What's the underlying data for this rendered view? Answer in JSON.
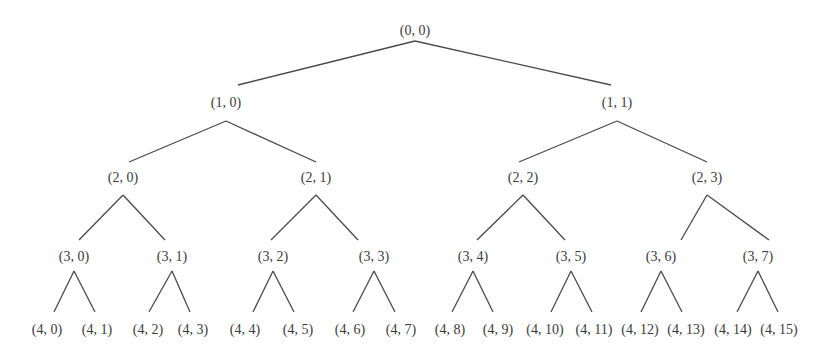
{
  "diagram": {
    "type": "binary-tree",
    "depth": 4,
    "colors": {
      "line": "#4a4a4a",
      "text": "#3a3a3a",
      "background": "#ffffff"
    },
    "levels": [
      {
        "level": 0,
        "label_y": 35,
        "apex_y": 41,
        "nodes": [
          {
            "label": "(0, 0)",
            "x": 415
          }
        ]
      },
      {
        "level": 1,
        "label_y": 107,
        "edge_end_y": 85,
        "apex_y": 121,
        "nodes": [
          {
            "label": "(1, 0)",
            "x": 226,
            "edge_end_x": 238
          },
          {
            "label": "(1, 1)",
            "x": 617,
            "edge_end_x": 611
          }
        ]
      },
      {
        "level": 2,
        "label_y": 182,
        "edge_end_y": 162,
        "apex_y": 195,
        "nodes": [
          {
            "label": "(2, 0)",
            "x": 123,
            "edge_end_x": 129
          },
          {
            "label": "(2, 1)",
            "x": 316,
            "edge_end_x": 316
          },
          {
            "label": "(2, 2)",
            "x": 523,
            "edge_end_x": 519
          },
          {
            "label": "(2, 3)",
            "x": 707,
            "edge_end_x": 707
          }
        ]
      },
      {
        "level": 3,
        "label_y": 261,
        "edge_end_y": 240,
        "apex_y": 271,
        "nodes": [
          {
            "label": "(3, 0)",
            "x": 74,
            "edge_end_x": 79
          },
          {
            "label": "(3, 1)",
            "x": 172,
            "edge_end_x": 165
          },
          {
            "label": "(3, 2)",
            "x": 273,
            "edge_end_x": 271
          },
          {
            "label": "(3, 3)",
            "x": 374,
            "edge_end_x": 358
          },
          {
            "label": "(3, 4)",
            "x": 473,
            "edge_end_x": 477
          },
          {
            "label": "(3, 5)",
            "x": 571,
            "edge_end_x": 565
          },
          {
            "label": "(3, 6)",
            "x": 661,
            "edge_end_x": 681
          },
          {
            "label": "(3, 7)",
            "x": 758,
            "edge_end_x": 769
          }
        ]
      },
      {
        "level": 4,
        "label_y": 334,
        "edge_end_y": 312,
        "nodes": [
          {
            "label": "(4, 0)",
            "x": 47,
            "edge_end_x": 54
          },
          {
            "label": "(4, 1)",
            "x": 97,
            "edge_end_x": 95
          },
          {
            "label": "(4, 2)",
            "x": 148,
            "edge_end_x": 149
          },
          {
            "label": "(4, 3)",
            "x": 193,
            "edge_end_x": 190
          },
          {
            "label": "(4, 4)",
            "x": 245,
            "edge_end_x": 253
          },
          {
            "label": "(4, 5)",
            "x": 298,
            "edge_end_x": 294
          },
          {
            "label": "(4, 6)",
            "x": 350,
            "edge_end_x": 353
          },
          {
            "label": "(4, 7)",
            "x": 401,
            "edge_end_x": 395
          },
          {
            "label": "(4, 8)",
            "x": 450,
            "edge_end_x": 452
          },
          {
            "label": "(4, 9)",
            "x": 498,
            "edge_end_x": 493
          },
          {
            "label": "(4, 10)",
            "x": 545,
            "edge_end_x": 551
          },
          {
            "label": "(4, 11)",
            "x": 594,
            "edge_end_x": 592
          },
          {
            "label": "(4, 12)",
            "x": 640,
            "edge_end_x": 641
          },
          {
            "label": "(4, 13)",
            "x": 686,
            "edge_end_x": 682
          },
          {
            "label": "(4, 14)",
            "x": 733,
            "edge_end_x": 737
          },
          {
            "label": "(4, 15)",
            "x": 779,
            "edge_end_x": 778
          }
        ]
      }
    ]
  }
}
